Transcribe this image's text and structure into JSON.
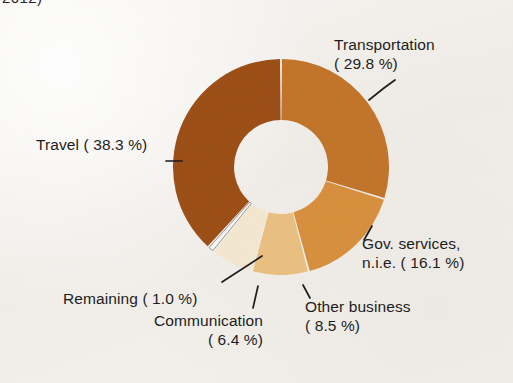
{
  "figure": {
    "clipped_caption": "2012)",
    "background_color": "#f2efeb",
    "text_color": "#1d1d1d"
  },
  "chart_data": {
    "type": "pie",
    "variant": "donut",
    "title": "",
    "subtitle": "",
    "xlabel": "",
    "ylabel": "",
    "units": "percent",
    "legend_position": "none",
    "grid": false,
    "labels_inline": true,
    "start_angle_deg": 0,
    "direction": "clockwise",
    "inner_radius_ratio": 0.435,
    "categories": [
      "Transportation",
      "Gov. services, n.i.e.",
      "Other business",
      "Communication",
      "Remaining",
      "Travel"
    ],
    "values": [
      29.8,
      16.1,
      8.5,
      6.4,
      1.0,
      38.3
    ],
    "colors": [
      "#c4762b",
      "#d9913f",
      "#ecc183",
      "#f6e9d2",
      "#fbf8f2",
      "#9e5016"
    ],
    "slices": [
      {
        "label": "Transportation",
        "value": 29.8,
        "value_text": "29.8 %",
        "color": "#c4762b"
      },
      {
        "label": "Gov. services, n.i.e.",
        "value": 16.1,
        "value_text": "16.1 %",
        "color": "#d9913f"
      },
      {
        "label": "Other business",
        "value": 8.5,
        "value_text": "8.5 %",
        "color": "#ecc183"
      },
      {
        "label": "Communication",
        "value": 6.4,
        "value_text": "6.4 %",
        "color": "#f6e9d2"
      },
      {
        "label": "Remaining",
        "value": 1.0,
        "value_text": "1.0 %",
        "color": "#fbf8f2"
      },
      {
        "label": "Travel",
        "value": 38.3,
        "value_text": "38.3 %",
        "color": "#9e5016"
      }
    ]
  },
  "labels": {
    "transportation": {
      "line1": "Transportation",
      "line2": "( 29.8 %)"
    },
    "travel": {
      "line1": "Travel ( 38.3 %)"
    },
    "gov_services": {
      "line1": "Gov. services,",
      "line2": "n.i.e. ( 16.1 %)"
    },
    "other_business": {
      "line1": "Other business",
      "line2": "( 8.5 %)"
    },
    "remaining": {
      "line1": "Remaining (  1.0 %)"
    },
    "communication": {
      "line1": "Communication",
      "line2": "( 6.4 %)"
    }
  }
}
